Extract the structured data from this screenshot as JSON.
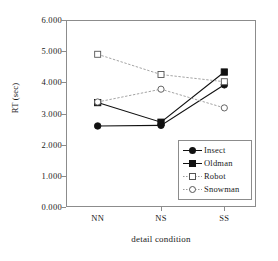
{
  "chart_data": {
    "type": "line",
    "title": "",
    "xlabel": "detail condition",
    "ylabel": "RT (sec)",
    "categories": [
      "NN",
      "NS",
      "SS"
    ],
    "ylim": [
      0,
      6
    ],
    "yticks": [
      "0.000",
      "1.000",
      "2.000",
      "3.000",
      "4.000",
      "5.000",
      "6.000"
    ],
    "ytick_values": [
      0,
      1,
      2,
      3,
      4,
      5,
      6
    ],
    "grid": false,
    "legend_position": "inside lower-right",
    "series": [
      {
        "name": "Insect",
        "values": [
          2.6,
          2.62,
          3.92
        ],
        "marker": "filled-circle",
        "line": "solid",
        "color": "#111111"
      },
      {
        "name": "Oldman",
        "values": [
          3.35,
          2.72,
          4.33
        ],
        "marker": "filled-square",
        "line": "solid",
        "color": "#111111"
      },
      {
        "name": "Robot",
        "values": [
          4.9,
          4.25,
          4.02
        ],
        "marker": "open-square",
        "line": "dotted",
        "color": "#9a9a9a"
      },
      {
        "name": "Snowman",
        "values": [
          3.37,
          3.78,
          3.18
        ],
        "marker": "open-circle",
        "line": "dotted",
        "color": "#9a9a9a"
      }
    ]
  },
  "axis": {
    "frame_color": "#8c8c8c"
  }
}
